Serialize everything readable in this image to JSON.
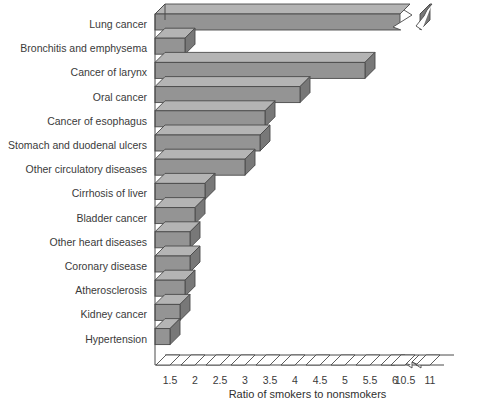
{
  "chart_data": {
    "type": "bar",
    "orientation": "horizontal",
    "title": "",
    "xlabel": "Ratio of smokers to nonsmokers",
    "ylabel": "",
    "xlim": [
      1.2,
      11.2
    ],
    "grid": false,
    "legend": null,
    "axis_break": {
      "after": 6,
      "before": 10.5,
      "note": "x-axis broken between 6 and 10.5"
    },
    "tick_labels": [
      "1.5",
      "2",
      "2.5",
      "3",
      "3.5",
      "4",
      "4.5",
      "5",
      "5.5",
      "6",
      "10.5",
      "11"
    ],
    "tick_values": [
      1.5,
      2,
      2.5,
      3,
      3.5,
      4,
      4.5,
      5,
      5.5,
      6,
      10.5,
      11
    ],
    "categories": [
      "Lung cancer",
      "Bronchitis and emphysema",
      "Cancer of larynx",
      "Oral cancer",
      "Cancer of esophagus",
      "Stomach and duodenal ulcers",
      "Other circulatory diseases",
      "Cirrhosis of liver",
      "Bladder cancer",
      "Other heart diseases",
      "Coronary disease",
      "Atherosclerosis",
      "Kidney cancer",
      "Hypertension"
    ],
    "values": [
      10.8,
      6.1,
      5.4,
      4.1,
      3.4,
      3.3,
      3.0,
      2.2,
      2.0,
      1.9,
      1.9,
      1.8,
      1.7,
      1.5
    ],
    "value_truncated": [
      true,
      false,
      false,
      false,
      false,
      false,
      false,
      false,
      false,
      false,
      false,
      false,
      false,
      false
    ]
  }
}
